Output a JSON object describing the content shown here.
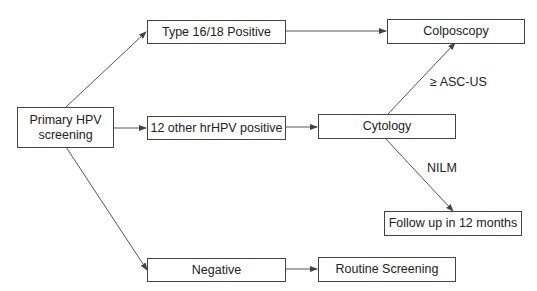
{
  "diagram": {
    "nodes": {
      "primary": "Primary HPV screening",
      "primary_line1": "Primary HPV",
      "primary_line2": "screening",
      "type1618": "Type 16/18 Positive",
      "other_hrhpv": "12 other hrHPV positive",
      "negative": "Negative",
      "colposcopy": "Colposcopy",
      "cytology": "Cytology",
      "followup": "Follow up in 12 months",
      "routine": "Routine Screening"
    },
    "edge_labels": {
      "asc_us": "≥ ASC-US",
      "nilm": "NILM"
    },
    "edges": [
      {
        "from": "primary",
        "to": "type1618"
      },
      {
        "from": "primary",
        "to": "other_hrhpv"
      },
      {
        "from": "primary",
        "to": "negative"
      },
      {
        "from": "type1618",
        "to": "colposcopy"
      },
      {
        "from": "other_hrhpv",
        "to": "cytology"
      },
      {
        "from": "cytology",
        "to": "colposcopy",
        "label": "≥ ASC-US"
      },
      {
        "from": "cytology",
        "to": "followup",
        "label": "NILM"
      },
      {
        "from": "negative",
        "to": "routine"
      }
    ],
    "colors": {
      "stroke": "#444444",
      "text": "#222222",
      "background": "#ffffff"
    }
  }
}
